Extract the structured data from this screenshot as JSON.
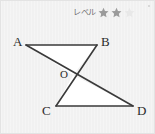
{
  "card": {
    "background_color": "#f1f1f1",
    "border_color": "#e3e3e3"
  },
  "level_badge": {
    "label": "レベル",
    "stars_total": 3,
    "stars_filled": 2,
    "filled_color": "#9b9b9b",
    "empty_color": "#e8e8e8",
    "star_icon_name": "star-icon"
  },
  "figure": {
    "title": "",
    "stroke_color": "#3a3a3a",
    "fill_color": "#ffffff",
    "points": {
      "A": {
        "label": "A",
        "x": 25,
        "y": 44,
        "label_x": 12,
        "label_y": 34
      },
      "B": {
        "label": "B",
        "x": 96,
        "y": 44,
        "label_x": 100,
        "label_y": 34
      },
      "O": {
        "label": "O",
        "x": 72,
        "y": 74,
        "label_x": 59,
        "label_y": 68
      },
      "C": {
        "label": "C",
        "x": 55,
        "y": 105,
        "label_x": 41,
        "label_y": 103
      },
      "D": {
        "label": "D",
        "x": 132,
        "y": 105,
        "label_x": 136,
        "label_y": 103
      }
    },
    "segments": [
      {
        "name": "segment-AB",
        "from": "A",
        "to": "B"
      },
      {
        "name": "segment-AD",
        "from": "A",
        "to": "D"
      },
      {
        "name": "segment-BC",
        "from": "B",
        "to": "C"
      },
      {
        "name": "segment-CD",
        "from": "C",
        "to": "D"
      }
    ],
    "triangles": [
      {
        "name": "triangle-AOB",
        "vertices": "A,O,B"
      },
      {
        "name": "triangle-COD",
        "vertices": "C,O,D"
      }
    ]
  }
}
